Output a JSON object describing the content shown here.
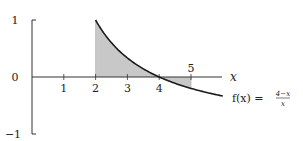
{
  "chart_data": {
    "type": "line",
    "title": "",
    "xlabel": "x",
    "ylabel": "",
    "function_label": "f(x) = (4−x)/x",
    "function_label_parts": {
      "lhs": "f(x) =",
      "numerator": "4−x",
      "denominator": "x"
    },
    "xlim": [
      0,
      6.2
    ],
    "ylim": [
      -1,
      1
    ],
    "x_ticks": [
      "1",
      "2",
      "3",
      "4",
      "5"
    ],
    "y_ticks": [
      "1",
      "0",
      "−1"
    ],
    "series": [
      {
        "name": "f(x) = (4−x)/x",
        "x": [
          2,
          2.5,
          3,
          3.5,
          4,
          4.5,
          5,
          5.5,
          6
        ],
        "values": [
          1,
          0.6,
          0.333,
          0.143,
          0,
          -0.111,
          -0.2,
          -0.273,
          -0.333
        ]
      }
    ],
    "shaded_regions": [
      {
        "from": 2,
        "to": 4,
        "sign": "positive",
        "color": "#c8c8c8"
      },
      {
        "from": 4,
        "to": 5,
        "sign": "negative",
        "color": "#c8c8c8"
      }
    ],
    "grid": false
  },
  "colors": {
    "curve": "#1a1a1a",
    "axis": "#333333",
    "shade": "#c8c8c8"
  }
}
